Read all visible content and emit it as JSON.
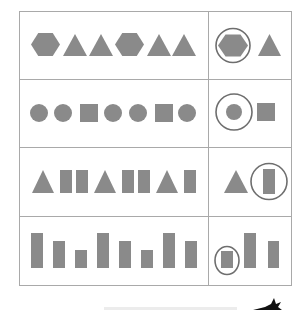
{
  "worksheet": {
    "title": "Pattern completion worksheet",
    "instructions": "Circle the shape that comes next in each pattern.",
    "colors": {
      "background": "#ffffff",
      "grid_line": "#a9a9a9",
      "shape_fill": "#8a8a8a",
      "answer_circle": "#6e6e6e",
      "footer_bar": "#ececec",
      "ink_blob": "#111111"
    },
    "grid": {
      "left": 19,
      "top": 11,
      "right": 291,
      "bottom": 285,
      "divider_x": 208,
      "row_lines": [
        79,
        147,
        216
      ]
    },
    "rows": [
      {
        "name": "hexagon-triangle-pattern",
        "sequence": [
          {
            "shape": "hexagon",
            "cx": 45.5,
            "cy": 44.5,
            "w": 29,
            "h": 23
          },
          {
            "shape": "triangle",
            "x": 63,
            "apex": 34,
            "base": 56,
            "w": 24
          },
          {
            "shape": "triangle",
            "x": 89,
            "apex": 34,
            "base": 56,
            "w": 24
          },
          {
            "shape": "hexagon",
            "cx": 129.5,
            "cy": 44.5,
            "w": 29,
            "h": 23
          },
          {
            "shape": "triangle",
            "x": 147,
            "apex": 34,
            "base": 56,
            "w": 24
          },
          {
            "shape": "triangle",
            "x": 172,
            "apex": 34,
            "base": 56,
            "w": 24
          }
        ],
        "choices": [
          {
            "shape": "hexagon",
            "cx": 233,
            "cy": 45.5,
            "w": 30,
            "h": 22,
            "circled": true,
            "ring_r": 17
          },
          {
            "shape": "triangle",
            "x": 258,
            "apex": 34,
            "base": 56,
            "w": 23,
            "circled": false
          }
        ]
      },
      {
        "name": "circle-square-pattern",
        "sequence": [
          {
            "shape": "circle",
            "cx": 39,
            "cy": 113,
            "r": 9
          },
          {
            "shape": "circle",
            "cx": 63,
            "cy": 113,
            "r": 9
          },
          {
            "shape": "square",
            "x": 80,
            "y": 104,
            "w": 18,
            "h": 18
          },
          {
            "shape": "circle",
            "cx": 113,
            "cy": 113,
            "r": 9
          },
          {
            "shape": "circle",
            "cx": 138,
            "cy": 113,
            "r": 9
          },
          {
            "shape": "square",
            "x": 155,
            "y": 104,
            "w": 18,
            "h": 18
          },
          {
            "shape": "circle",
            "cx": 187,
            "cy": 113,
            "r": 9
          }
        ],
        "choices": [
          {
            "shape": "circle",
            "cx": 234,
            "cy": 112,
            "r": 8,
            "circled": true,
            "ring_r": 18
          },
          {
            "shape": "square",
            "x": 257,
            "y": 103,
            "w": 18,
            "h": 18,
            "circled": false
          }
        ]
      },
      {
        "name": "triangle-rectangle-pattern",
        "sequence": [
          {
            "shape": "triangle",
            "x": 32,
            "apex": 170,
            "base": 193,
            "w": 22
          },
          {
            "shape": "rect",
            "x": 60,
            "y": 170,
            "w": 12,
            "h": 23
          },
          {
            "shape": "rect",
            "x": 76,
            "y": 170,
            "w": 12,
            "h": 23
          },
          {
            "shape": "triangle",
            "x": 94,
            "apex": 170,
            "base": 193,
            "w": 22
          },
          {
            "shape": "rect",
            "x": 122,
            "y": 170,
            "w": 12,
            "h": 23
          },
          {
            "shape": "rect",
            "x": 138,
            "y": 170,
            "w": 12,
            "h": 23
          },
          {
            "shape": "triangle",
            "x": 156,
            "apex": 170,
            "base": 193,
            "w": 22
          },
          {
            "shape": "rect",
            "x": 184,
            "y": 170,
            "w": 12,
            "h": 23
          }
        ],
        "choices": [
          {
            "shape": "triangle",
            "x": 224,
            "apex": 170,
            "base": 193,
            "w": 24,
            "circled": false
          },
          {
            "shape": "rect",
            "x": 263,
            "y": 169,
            "w": 12,
            "h": 25,
            "circled": true,
            "ring_r": 18
          }
        ]
      },
      {
        "name": "bar-height-pattern",
        "sequence": [
          {
            "shape": "bar",
            "height_class": "tall",
            "x": 31,
            "top": 233,
            "bottom": 268,
            "w": 12
          },
          {
            "shape": "bar",
            "height_class": "medium",
            "x": 53,
            "top": 241,
            "bottom": 268,
            "w": 12
          },
          {
            "shape": "bar",
            "height_class": "short",
            "x": 75,
            "top": 250,
            "bottom": 268,
            "w": 12
          },
          {
            "shape": "bar",
            "height_class": "tall",
            "x": 97,
            "top": 233,
            "bottom": 268,
            "w": 12
          },
          {
            "shape": "bar",
            "height_class": "medium",
            "x": 119,
            "top": 241,
            "bottom": 268,
            "w": 12
          },
          {
            "shape": "bar",
            "height_class": "short",
            "x": 141,
            "top": 250,
            "bottom": 268,
            "w": 12
          },
          {
            "shape": "bar",
            "height_class": "tall",
            "x": 163,
            "top": 233,
            "bottom": 268,
            "w": 12
          },
          {
            "shape": "bar",
            "height_class": "medium",
            "x": 185,
            "top": 241,
            "bottom": 268,
            "w": 12
          }
        ],
        "choices": [
          {
            "shape": "bar",
            "height_class": "short",
            "x": 221,
            "top": 251,
            "bottom": 268,
            "w": 12,
            "circled": true,
            "ring_rx": 12,
            "ring_ry": 14
          },
          {
            "shape": "bar",
            "height_class": "tall",
            "x": 244,
            "top": 233,
            "bottom": 268,
            "w": 12,
            "circled": false
          },
          {
            "shape": "bar",
            "height_class": "medium",
            "x": 268,
            "top": 241,
            "bottom": 268,
            "w": 11,
            "circled": false
          }
        ]
      }
    ],
    "footer": {
      "bar": {
        "x": 104,
        "y": 307,
        "w": 133,
        "h": 3
      },
      "ink_blob": {
        "x": 253,
        "y": 299
      }
    }
  }
}
